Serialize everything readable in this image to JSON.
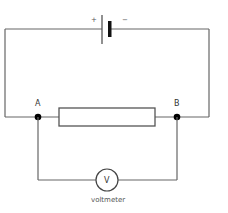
{
  "diagram": {
    "type": "circuit",
    "battery": {
      "positive_label": "+",
      "negative_label": "−"
    },
    "nodes": [
      {
        "id": "A",
        "label": "A"
      },
      {
        "id": "B",
        "label": "B"
      }
    ],
    "components": [
      {
        "type": "cell",
        "between": [
          "left-wire",
          "right-wire"
        ]
      },
      {
        "type": "resistor",
        "between": [
          "A",
          "B"
        ]
      },
      {
        "type": "voltmeter",
        "symbol": "V",
        "label": "voltmeter",
        "between": [
          "A",
          "B"
        ]
      }
    ],
    "voltmeter": {
      "symbol": "V",
      "label": "voltmeter"
    },
    "colors": {
      "wire": "#666666",
      "node": "#000000",
      "cell_plate": "#111111"
    }
  }
}
